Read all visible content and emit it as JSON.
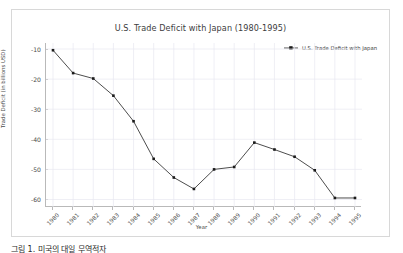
{
  "figure": {
    "title": "U.S. Trade Deficit with Japan (1980-1995)",
    "xlabel": "Year",
    "ylabel": "Trade Deficit (in billions USD)",
    "legend_label": "U.S. Trade Deficit with Japan",
    "line_color": "#4d4d4d",
    "marker_color": "#1a1a1a",
    "grid_color": "#e8e8f0",
    "axis_color": "#b9b9b9",
    "background": "#ffffff"
  },
  "caption": {
    "text": "그림 1. 미국의 대일 무역적자"
  },
  "chart_data": {
    "type": "line",
    "title": "U.S. Trade Deficit with Japan (1980-1995)",
    "xlabel": "Year",
    "ylabel": "Trade Deficit (in billions USD)",
    "grid": true,
    "legend_position": "top-right",
    "categories": [
      "1980",
      "1981",
      "1982",
      "1983",
      "1984",
      "1985",
      "1986",
      "1987",
      "1988",
      "1989",
      "1990",
      "1991",
      "1992",
      "1993",
      "1994",
      "1995"
    ],
    "x_tick_labels": [
      "1980",
      "1981",
      "1982",
      "1983",
      "1984",
      "1985",
      "1986",
      "1987",
      "1988",
      "1989",
      "1990",
      "1991",
      "1992",
      "1993",
      "1994",
      "1995"
    ],
    "y_tick_labels": [
      "-10",
      "-20",
      "-30",
      "-40",
      "-50",
      "-60"
    ],
    "y_ticks": [
      -10,
      -20,
      -30,
      -40,
      -50,
      -60
    ],
    "ylim": [
      -62.5,
      -8.0
    ],
    "series": [
      {
        "name": "U.S. Trade Deficit with Japan",
        "values": [
          -10.4,
          -18.0,
          -19.8,
          -25.5,
          -34.0,
          -46.5,
          -52.7,
          -56.5,
          -50.0,
          -49.2,
          -41.1,
          -43.4,
          -45.8,
          -50.3,
          -59.5,
          -59.5
        ]
      }
    ]
  }
}
